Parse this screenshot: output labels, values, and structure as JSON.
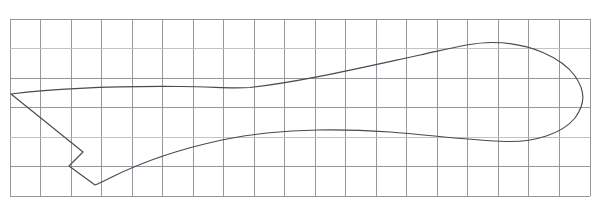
{
  "figure": {
    "background_color": "#ffffff",
    "canvas": {
      "width": 600,
      "height": 206
    }
  },
  "grid": {
    "line_color": "#888d91",
    "faint_line_color": "#b9bdc0",
    "stroke_width": 0.9,
    "x_start": 10,
    "x_end": 590,
    "y_start": 19,
    "y_end": 196,
    "columns": 19,
    "rows": 6,
    "cell_width": 30.5,
    "cell_height": 29.5,
    "vertical_line_x": [
      10,
      40.5,
      71,
      101.5,
      132,
      162.5,
      193,
      223.5,
      254,
      284.5,
      315,
      345.5,
      376,
      406.5,
      437,
      467.5,
      498,
      528.5,
      559,
      590
    ],
    "horizontal_line_y": [
      19,
      48.5,
      78,
      107.5,
      137,
      166.5,
      196
    ]
  },
  "shape": {
    "name": "foil-outline",
    "stroke_color": "#4a4a4f",
    "stroke_width": 1.15,
    "fill": "none",
    "description": "Closed outline: sharp leading point at left, long convex upper surface rising to a rounded bulb at right, returning along a lower surface, with a V-notch cut into the lower-left tail region.",
    "key_points": {
      "leading_point": [
        11,
        94
      ],
      "upper_crest_left": [
        180,
        87
      ],
      "upper_dip": [
        230,
        88
      ],
      "bulb_top": [
        487,
        42
      ],
      "bulb_right": [
        583,
        95
      ],
      "bulb_bottom": [
        505,
        141
      ],
      "lower_flat": [
        330,
        130
      ],
      "notch_inner_upper": [
        83,
        152
      ],
      "notch_inner_left": [
        69,
        166
      ],
      "notch_bottom_vertex": [
        95,
        185
      ]
    },
    "path_d": "M 11,94 C 60,88 120,86 180,86.5 C 215,86.8 232,89 250,87.5 C 300,82 360,68 420,55 C 452,48 472,42.5 492,42.5 C 530,42.5 562,58 575,76 C 586,92 585,104 575,118 C 562,134 534,142 507,141.5 C 470,140.5 430,135 390,132 C 360,130 340,129.5 318,130 C 290,130.6 255,133 222,140 C 180,149 140,163 112,177 C 104,181 99,183.5 95,185 L 69,166 L 83,152 L 11,94 Z"
  },
  "axes": {
    "show_labels": false,
    "show_ticks": false,
    "tick_labels": []
  },
  "annotations": []
}
